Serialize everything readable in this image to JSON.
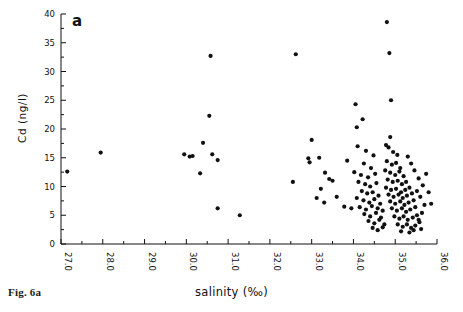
{
  "figure": {
    "caption": "Fig. 6a",
    "panel_label": "a"
  },
  "axis_titles": {
    "x": "salinity  (‰)",
    "y": "Cd  (ng/l)"
  },
  "chart_data": {
    "type": "scatter",
    "title": "",
    "xlabel": "salinity  (‰)",
    "ylabel": "Cd  (ng/l)",
    "xlim": [
      27.0,
      36.0
    ],
    "ylim": [
      0,
      40
    ],
    "xticks": [
      "27.0",
      "28.0",
      "29.0",
      "30.0",
      "31.0",
      "32.0",
      "33.0",
      "34.0",
      "35.0",
      "36.0"
    ],
    "xtick_values": [
      27,
      28,
      29,
      30,
      31,
      32,
      33,
      34,
      35,
      36
    ],
    "yticks": [
      "0",
      "5",
      "10",
      "15",
      "20",
      "25",
      "30",
      "35",
      "40"
    ],
    "ytick_values": [
      0,
      5,
      10,
      15,
      20,
      25,
      30,
      35,
      40
    ],
    "x_minor_step": 0.5,
    "y_minor_step": 2.5,
    "grid": false,
    "legend": null,
    "marker": "dot",
    "marker_color": "#111111",
    "marker_size": 2.1,
    "points": [
      [
        27.15,
        12.6
      ],
      [
        27.95,
        15.9
      ],
      [
        29.95,
        15.6
      ],
      [
        30.08,
        15.2
      ],
      [
        30.15,
        15.3
      ],
      [
        30.4,
        17.6
      ],
      [
        30.62,
        15.6
      ],
      [
        30.33,
        12.3
      ],
      [
        30.75,
        14.6
      ],
      [
        30.55,
        22.3
      ],
      [
        30.58,
        32.7
      ],
      [
        30.75,
        6.2
      ],
      [
        31.28,
        5.0
      ],
      [
        32.55,
        10.8
      ],
      [
        32.62,
        33.0
      ],
      [
        33.0,
        18.1
      ],
      [
        32.92,
        14.9
      ],
      [
        32.95,
        14.2
      ],
      [
        33.18,
        15.0
      ],
      [
        33.32,
        12.4
      ],
      [
        33.22,
        9.6
      ],
      [
        33.42,
        11.3
      ],
      [
        33.5,
        11.0
      ],
      [
        33.12,
        8.0
      ],
      [
        33.3,
        7.2
      ],
      [
        33.6,
        8.2
      ],
      [
        33.85,
        14.5
      ],
      [
        33.78,
        6.5
      ],
      [
        33.95,
        6.2
      ],
      [
        34.05,
        24.3
      ],
      [
        34.08,
        20.3
      ],
      [
        34.22,
        21.7
      ],
      [
        34.1,
        17.0
      ],
      [
        34.3,
        16.2
      ],
      [
        34.48,
        15.4
      ],
      [
        34.25,
        14.0
      ],
      [
        34.42,
        13.2
      ],
      [
        34.02,
        12.5
      ],
      [
        34.18,
        12.0
      ],
      [
        34.35,
        11.6
      ],
      [
        34.52,
        12.2
      ],
      [
        34.12,
        10.8
      ],
      [
        34.28,
        10.4
      ],
      [
        34.4,
        10.0
      ],
      [
        34.55,
        10.6
      ],
      [
        34.2,
        9.2
      ],
      [
        34.33,
        8.8
      ],
      [
        34.46,
        9.0
      ],
      [
        34.6,
        8.4
      ],
      [
        34.08,
        8.0
      ],
      [
        34.24,
        7.6
      ],
      [
        34.38,
        7.2
      ],
      [
        34.5,
        7.8
      ],
      [
        34.64,
        7.0
      ],
      [
        34.15,
        6.4
      ],
      [
        34.3,
        6.0
      ],
      [
        34.44,
        6.6
      ],
      [
        34.58,
        6.2
      ],
      [
        34.7,
        5.8
      ],
      [
        34.26,
        5.2
      ],
      [
        34.4,
        4.8
      ],
      [
        34.54,
        5.4
      ],
      [
        34.66,
        4.6
      ],
      [
        34.36,
        4.0
      ],
      [
        34.5,
        3.6
      ],
      [
        34.62,
        4.2
      ],
      [
        34.74,
        3.4
      ],
      [
        34.46,
        2.8
      ],
      [
        34.58,
        2.4
      ],
      [
        34.7,
        2.9
      ],
      [
        34.8,
        38.6
      ],
      [
        34.86,
        33.2
      ],
      [
        34.9,
        25.0
      ],
      [
        34.88,
        18.6
      ],
      [
        34.78,
        17.2
      ],
      [
        34.84,
        16.8
      ],
      [
        34.95,
        16.0
      ],
      [
        35.05,
        15.5
      ],
      [
        34.8,
        14.4
      ],
      [
        34.92,
        13.8
      ],
      [
        35.02,
        14.1
      ],
      [
        35.12,
        13.2
      ],
      [
        34.76,
        12.8
      ],
      [
        34.88,
        12.4
      ],
      [
        35.0,
        12.0
      ],
      [
        35.1,
        12.6
      ],
      [
        35.2,
        11.8
      ],
      [
        34.82,
        11.2
      ],
      [
        34.94,
        10.8
      ],
      [
        35.06,
        11.0
      ],
      [
        35.16,
        10.4
      ],
      [
        35.26,
        10.8
      ],
      [
        34.78,
        9.8
      ],
      [
        34.9,
        9.4
      ],
      [
        35.02,
        9.6
      ],
      [
        35.14,
        9.0
      ],
      [
        35.24,
        9.4
      ],
      [
        35.34,
        9.8
      ],
      [
        34.84,
        8.6
      ],
      [
        34.96,
        8.2
      ],
      [
        35.08,
        8.6
      ],
      [
        35.18,
        8.0
      ],
      [
        35.28,
        8.4
      ],
      [
        35.4,
        8.8
      ],
      [
        34.88,
        7.4
      ],
      [
        35.0,
        7.0
      ],
      [
        35.12,
        7.4
      ],
      [
        35.22,
        6.8
      ],
      [
        35.32,
        7.2
      ],
      [
        35.44,
        7.6
      ],
      [
        34.92,
        6.2
      ],
      [
        35.04,
        5.8
      ],
      [
        35.16,
        6.2
      ],
      [
        35.26,
        5.6
      ],
      [
        35.36,
        6.0
      ],
      [
        35.48,
        6.4
      ],
      [
        34.98,
        4.8
      ],
      [
        35.1,
        4.4
      ],
      [
        35.2,
        4.8
      ],
      [
        35.3,
        4.2
      ],
      [
        35.42,
        4.6
      ],
      [
        35.52,
        5.0
      ],
      [
        35.06,
        3.4
      ],
      [
        35.18,
        3.0
      ],
      [
        35.28,
        3.4
      ],
      [
        35.38,
        2.8
      ],
      [
        35.48,
        3.2
      ],
      [
        35.58,
        3.8
      ],
      [
        35.14,
        2.2
      ],
      [
        35.34,
        2.0
      ],
      [
        35.44,
        2.4
      ],
      [
        35.62,
        2.6
      ],
      [
        35.56,
        4.2
      ],
      [
        35.64,
        5.4
      ],
      [
        35.7,
        6.8
      ],
      [
        35.6,
        8.2
      ],
      [
        35.52,
        9.2
      ],
      [
        35.66,
        10.2
      ],
      [
        35.56,
        11.4
      ],
      [
        35.46,
        12.8
      ],
      [
        35.38,
        14.0
      ],
      [
        35.3,
        15.2
      ],
      [
        35.74,
        12.2
      ],
      [
        35.8,
        9.0
      ],
      [
        35.86,
        7.0
      ]
    ]
  }
}
